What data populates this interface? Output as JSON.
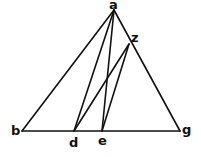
{
  "diagram": {
    "type": "geometric-figure",
    "points": {
      "a": {
        "x": 114,
        "y": 10,
        "label": "a",
        "lx": 109,
        "ly": 9
      },
      "b": {
        "x": 22,
        "y": 131,
        "label": "b",
        "lx": 11,
        "ly": 135
      },
      "g": {
        "x": 180,
        "y": 131,
        "label": "g",
        "lx": 182,
        "ly": 134
      },
      "d": {
        "x": 74,
        "y": 131,
        "label": "d",
        "lx": 69,
        "ly": 147
      },
      "e": {
        "x": 102,
        "y": 131,
        "label": "e",
        "lx": 98,
        "ly": 145
      },
      "z": {
        "x": 129,
        "y": 44,
        "label": "z",
        "lx": 131,
        "ly": 42
      }
    },
    "segments": [
      [
        "a",
        "b"
      ],
      [
        "a",
        "g"
      ],
      [
        "b",
        "g"
      ],
      [
        "a",
        "d"
      ],
      [
        "a",
        "e"
      ],
      [
        "z",
        "d"
      ],
      [
        "z",
        "e"
      ]
    ]
  }
}
